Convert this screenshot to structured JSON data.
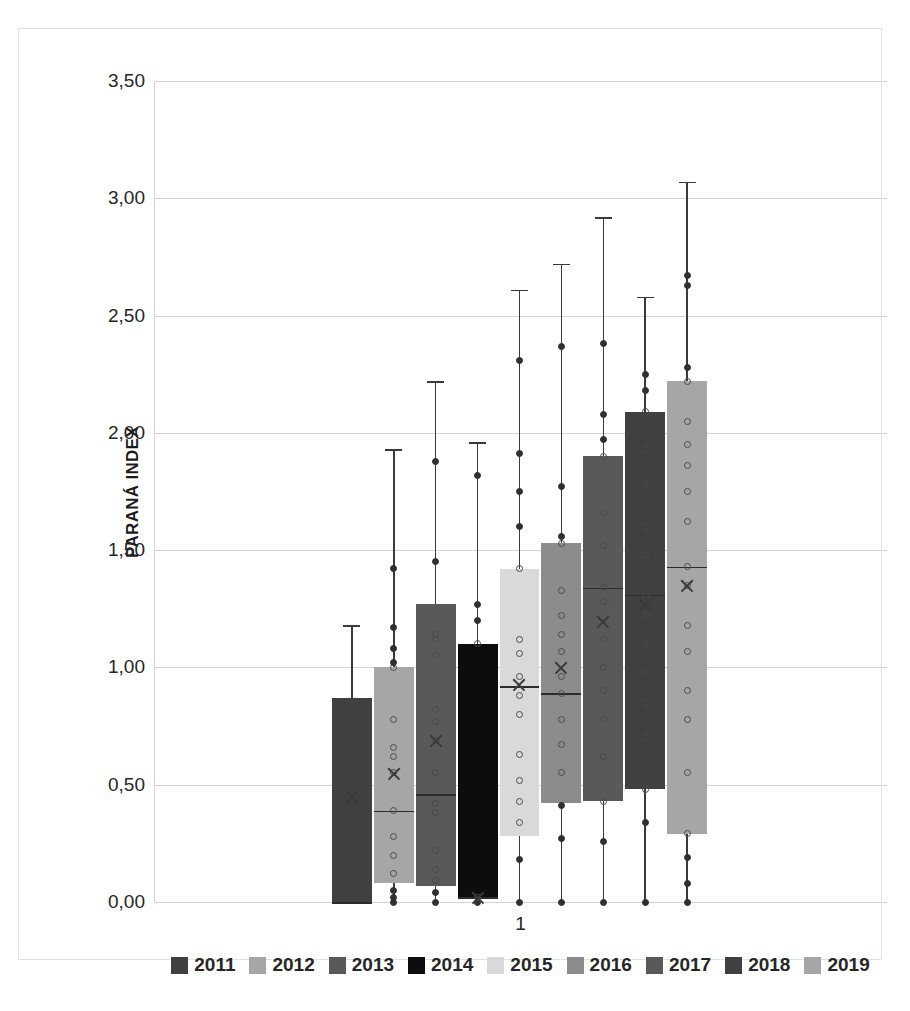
{
  "chart_data": {
    "type": "box",
    "title": "",
    "xlabel": "1",
    "ylabel": "PARANÁ INDEX",
    "ylim": [
      0.0,
      3.5
    ],
    "ytick_labels": [
      "3,50",
      "3,00",
      "2,50",
      "2,00",
      "1,50",
      "1,00",
      "0,50",
      "0,00"
    ],
    "ytick_values": [
      3.5,
      3.0,
      2.5,
      2.0,
      1.5,
      1.0,
      0.5,
      0.0
    ],
    "grid": true,
    "legend_position": "bottom",
    "categories": [
      "1"
    ],
    "series": [
      {
        "name": "2011",
        "color": "#404040",
        "q1": 0.0,
        "median": 0.0,
        "q3": 0.87,
        "mean": 0.45,
        "whisker_low": 0.0,
        "whisker_high": 1.18,
        "points": [
          0.45
        ]
      },
      {
        "name": "2012",
        "color": "#a6a6a6",
        "q1": 0.08,
        "median": 0.39,
        "q3": 1.0,
        "mean": 0.55,
        "whisker_low": 0.0,
        "whisker_high": 1.93,
        "points": [
          0.0,
          0.02,
          0.05,
          0.12,
          0.2,
          0.28,
          0.39,
          0.55,
          0.62,
          0.66,
          0.78,
          1.0,
          1.02,
          1.08,
          1.17,
          1.42
        ]
      },
      {
        "name": "2013",
        "color": "#595959",
        "q1": 0.07,
        "median": 0.46,
        "q3": 1.27,
        "mean": 0.69,
        "whisker_low": 0.0,
        "whisker_high": 2.22,
        "points": [
          0.0,
          0.04,
          0.09,
          0.14,
          0.22,
          0.38,
          0.42,
          0.55,
          0.69,
          0.77,
          0.82,
          1.05,
          1.12,
          1.14,
          1.45,
          1.88
        ]
      },
      {
        "name": "2014",
        "color": "#0d0d0d",
        "q1": 0.02,
        "median": 0.02,
        "q3": 1.1,
        "mean": 0.02,
        "whisker_low": 0.0,
        "whisker_high": 1.96,
        "points": [
          0.0,
          0.02,
          1.1,
          1.2,
          1.27,
          1.82
        ]
      },
      {
        "name": "2015",
        "color": "#d9d9d9",
        "q1": 0.28,
        "median": 0.92,
        "q3": 1.42,
        "mean": 0.93,
        "whisker_low": 0.0,
        "whisker_high": 2.61,
        "points": [
          0.0,
          0.18,
          0.34,
          0.43,
          0.52,
          0.63,
          0.8,
          0.88,
          0.96,
          1.06,
          1.12,
          1.42,
          1.6,
          1.75,
          1.91,
          2.31
        ]
      },
      {
        "name": "2016",
        "color": "#8c8c8c",
        "q1": 0.42,
        "median": 0.89,
        "q3": 1.53,
        "mean": 1.0,
        "whisker_low": 0.0,
        "whisker_high": 2.72,
        "points": [
          0.0,
          0.27,
          0.41,
          0.55,
          0.67,
          0.78,
          0.89,
          0.96,
          1.07,
          1.14,
          1.22,
          1.33,
          1.53,
          1.56,
          1.77,
          2.37
        ]
      },
      {
        "name": "2017",
        "color": "#595959",
        "q1": 0.43,
        "median": 1.34,
        "q3": 1.9,
        "mean": 1.2,
        "whisker_low": 0.0,
        "whisker_high": 2.92,
        "points": [
          0.0,
          0.26,
          0.43,
          0.62,
          0.78,
          0.9,
          1.0,
          1.12,
          1.28,
          1.34,
          1.52,
          1.66,
          1.9,
          1.97,
          2.08,
          2.38
        ]
      },
      {
        "name": "2018",
        "color": "#404040",
        "q1": 0.48,
        "median": 1.31,
        "q3": 2.09,
        "mean": 1.27,
        "whisker_low": 0.0,
        "whisker_high": 2.58,
        "points": [
          0.0,
          0.34,
          0.48,
          0.7,
          0.85,
          0.98,
          1.1,
          1.22,
          1.31,
          1.48,
          1.6,
          1.78,
          1.93,
          2.09,
          2.18,
          2.25
        ]
      },
      {
        "name": "2019",
        "color": "#a6a6a6",
        "q1": 0.29,
        "median": 1.43,
        "q3": 2.22,
        "mean": 1.35,
        "whisker_low": 0.0,
        "whisker_high": 3.07,
        "points": [
          0.0,
          0.08,
          0.19,
          0.29,
          0.55,
          0.78,
          0.9,
          1.07,
          1.18,
          1.35,
          1.43,
          1.62,
          1.75,
          1.86,
          1.95,
          2.05,
          2.22,
          2.28,
          2.63,
          2.67
        ]
      }
    ]
  }
}
